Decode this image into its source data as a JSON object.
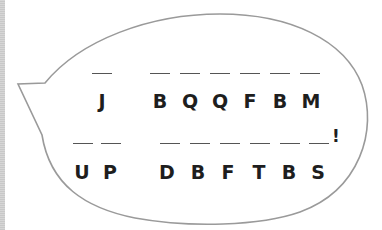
{
  "puzzle": {
    "type": "letter-substitution-cipher",
    "line1": {
      "words": [
        {
          "letters": [
            "J"
          ]
        },
        {
          "letters": [
            "B",
            "Q",
            "Q",
            "F",
            "B",
            "M"
          ]
        }
      ]
    },
    "line2": {
      "words": [
        {
          "letters": [
            "U",
            "P"
          ]
        },
        {
          "letters": [
            "D",
            "B",
            "F",
            "T",
            "B",
            "S"
          ]
        }
      ],
      "end_punctuation": "!"
    }
  },
  "colors": {
    "bubble_stroke": "#9a9a9a",
    "text": "#1e1e1e",
    "blank_line": "#555555",
    "left_strip": "#cccccc"
  }
}
